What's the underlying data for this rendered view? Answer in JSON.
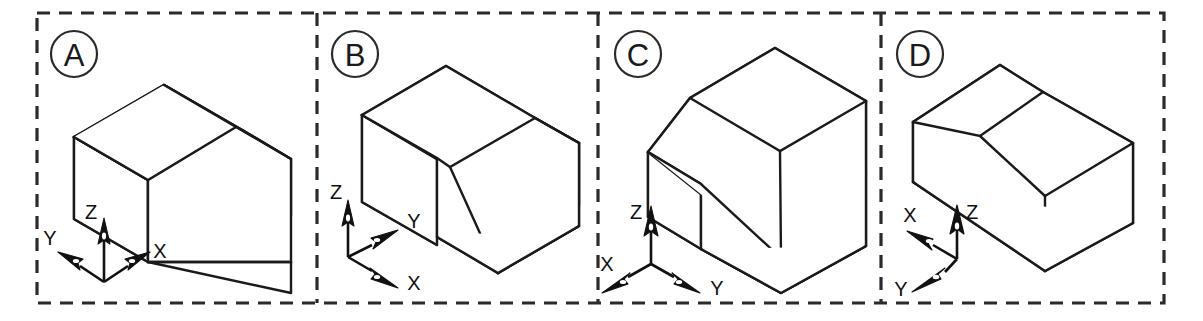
{
  "figure": {
    "width": 1203,
    "height": 321,
    "background_color": "#ffffff",
    "line_color": "#1a1a1a",
    "border_color": "#2b2b2b",
    "border_style": "dashed"
  },
  "panels": [
    {
      "id": "A",
      "letter": "A",
      "badge_name": "panel-label-a",
      "object": "chamfered-rectangular-block",
      "axes": [
        {
          "name": "Z",
          "direction": "up"
        },
        {
          "name": "Y",
          "direction": "upper-left"
        },
        {
          "name": "X",
          "direction": "upper-right"
        }
      ]
    },
    {
      "id": "B",
      "letter": "B",
      "badge_name": "panel-label-b",
      "object": "chamfered-rectangular-block",
      "axes": [
        {
          "name": "Z",
          "direction": "up"
        },
        {
          "name": "Y",
          "direction": "upper-right"
        },
        {
          "name": "X",
          "direction": "lower-right"
        }
      ]
    },
    {
      "id": "C",
      "letter": "C",
      "badge_name": "panel-label-c",
      "object": "chamfered-rectangular-block",
      "axes": [
        {
          "name": "Z",
          "direction": "up"
        },
        {
          "name": "X",
          "direction": "lower-left"
        },
        {
          "name": "Y",
          "direction": "lower-right"
        }
      ]
    },
    {
      "id": "D",
      "letter": "D",
      "badge_name": "panel-label-d",
      "object": "chamfered-rectangular-block",
      "axes": [
        {
          "name": "Z",
          "direction": "up"
        },
        {
          "name": "X",
          "direction": "upper-left"
        },
        {
          "name": "Y",
          "direction": "lower-left"
        }
      ]
    }
  ],
  "labels": {
    "a": "A",
    "b": "B",
    "c": "C",
    "d": "D",
    "axis_x": "X",
    "axis_y": "Y",
    "axis_z": "Z"
  }
}
